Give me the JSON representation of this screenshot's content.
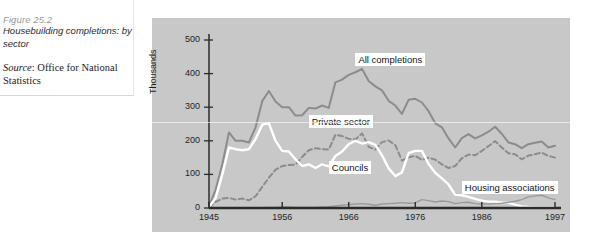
{
  "caption": {
    "figure_number": "Figure 25.2",
    "title": "Housebuilding completions: by sector",
    "source_word": "Source",
    "source_rest": ": Office for National Statistics"
  },
  "chart_data": {
    "type": "line",
    "title": "Housebuilding completions: by sector",
    "xlabel": "",
    "ylabel": "Thousands",
    "xlim": [
      1945,
      1997
    ],
    "ylim": [
      0,
      500
    ],
    "yticks": [
      0,
      100,
      200,
      300,
      400,
      500
    ],
    "ytick_labels": [
      "0",
      "100",
      "200",
      "300",
      "400",
      "500"
    ],
    "xticks": [
      1945,
      1956,
      1966,
      1976,
      1986,
      1997
    ],
    "xtick_labels": [
      "1945",
      "1956",
      "1966",
      "1976",
      "1986",
      "1997"
    ],
    "grid": false,
    "legend": "inline-labels",
    "colors": {
      "all_completions": "#8c8c8c",
      "private_sector": "#8c8c8c",
      "councils": "#ffffff",
      "housing_associations": "#9a9a9a",
      "panel_background": "#c8c8c8",
      "axis": "#2b2b2b"
    },
    "x": [
      1945,
      1946,
      1947,
      1948,
      1949,
      1950,
      1951,
      1952,
      1953,
      1954,
      1955,
      1956,
      1957,
      1958,
      1959,
      1960,
      1961,
      1962,
      1963,
      1964,
      1965,
      1966,
      1967,
      1968,
      1969,
      1970,
      1971,
      1972,
      1973,
      1974,
      1975,
      1976,
      1977,
      1978,
      1979,
      1980,
      1981,
      1982,
      1983,
      1984,
      1985,
      1986,
      1987,
      1988,
      1989,
      1990,
      1991,
      1992,
      1993,
      1994,
      1995,
      1996,
      1997
    ],
    "series": [
      {
        "name": "All completions",
        "style": "solid",
        "color": "#8c8c8c",
        "values": [
          5,
          55,
          130,
          225,
          200,
          200,
          195,
          240,
          318,
          348,
          317,
          300,
          300,
          275,
          276,
          298,
          296,
          305,
          298,
          374,
          382,
          396,
          404,
          414,
          378,
          362,
          350,
          319,
          305,
          280,
          322,
          325,
          314,
          288,
          252,
          240,
          207,
          180,
          208,
          220,
          207,
          216,
          227,
          242,
          221,
          195,
          190,
          178,
          190,
          194,
          198,
          180,
          185
        ]
      },
      {
        "name": "Private sector",
        "style": "dashed",
        "color": "#8c8c8c",
        "values": [
          2,
          18,
          28,
          30,
          25,
          28,
          23,
          35,
          63,
          90,
          114,
          125,
          128,
          129,
          152,
          172,
          178,
          175,
          174,
          218,
          214,
          206,
          204,
          222,
          182,
          174,
          196,
          201,
          187,
          141,
          151,
          155,
          143,
          150,
          144,
          130,
          119,
          125,
          148,
          159,
          157,
          170,
          184,
          199,
          180,
          163,
          160,
          145,
          156,
          160,
          165,
          155,
          150
        ]
      },
      {
        "name": "Councils",
        "style": "solid",
        "color": "#ffffff",
        "values": [
          3,
          30,
          100,
          180,
          175,
          172,
          175,
          205,
          248,
          252,
          200,
          170,
          168,
          145,
          125,
          130,
          119,
          130,
          124,
          155,
          168,
          190,
          200,
          192,
          196,
          188,
          157,
          118,
          95,
          106,
          163,
          170,
          170,
          131,
          105,
          88,
          70,
          39,
          38,
          33,
          27,
          22,
          19,
          19,
          16,
          16,
          10,
          5,
          3,
          2,
          2,
          2,
          2
        ]
      },
      {
        "name": "Housing associations",
        "style": "solid",
        "color": "#9a9a9a",
        "values": [
          0,
          0,
          0,
          0,
          0,
          0,
          0,
          0,
          1,
          2,
          2,
          3,
          3,
          2,
          2,
          2,
          2,
          3,
          4,
          6,
          8,
          10,
          12,
          13,
          11,
          8,
          12,
          13,
          14,
          16,
          14,
          15,
          25,
          22,
          18,
          21,
          19,
          13,
          16,
          17,
          13,
          12,
          12,
          13,
          14,
          17,
          20,
          25,
          33,
          36,
          38,
          30,
          25
        ]
      }
    ],
    "annotations": [
      {
        "text": "All completions",
        "x": 1967,
        "y": 440
      },
      {
        "text": "Private sector",
        "x": 1960,
        "y": 255
      },
      {
        "text": "Councils",
        "x": 1963,
        "y": 120
      },
      {
        "text": "Housing associations",
        "x": 1983,
        "y": 60
      }
    ]
  }
}
